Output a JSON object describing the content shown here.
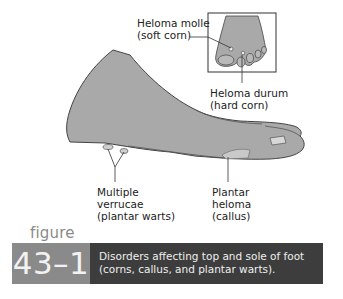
{
  "labels": {
    "heloma_molle": [
      "Heloma molle",
      "(soft corn)"
    ],
    "heloma_durum": [
      "Heloma durum",
      "(hard corn)"
    ],
    "verrucae": [
      "Multiple",
      "verrucae",
      "(plantar warts)"
    ],
    "plantar_heloma": [
      "Plantar",
      "heloma",
      "(callus)"
    ]
  },
  "figure": {
    "word": "figure",
    "number": "43–1",
    "caption": [
      "Disorders affecting top and sole of foot",
      "(corns, callus, and plantar warts)."
    ]
  },
  "colors": {
    "skin": "#a9a9a9",
    "number_box": "#8a8a8a",
    "caption_box": "#3d3d3d"
  }
}
